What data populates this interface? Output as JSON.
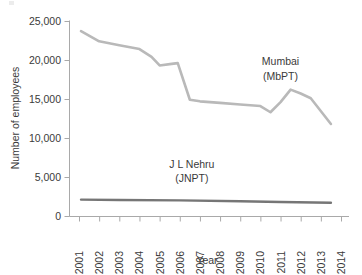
{
  "chart_data": {
    "type": "line",
    "title": "",
    "subtitle": "",
    "xlabel": "Year",
    "ylabel": "Number of employees",
    "xlim": [
      2001,
      2014
    ],
    "ylim": [
      0,
      25000
    ],
    "grid": false,
    "legend_position": "inline-annotations",
    "x_ticks": [
      "2001",
      "2002",
      "2003",
      "2004",
      "2005",
      "2006",
      "2007",
      "2008",
      "2009",
      "2010",
      "2011",
      "2012",
      "2013",
      "2014"
    ],
    "y_ticks": [
      "0",
      "5,000",
      "10,000",
      "15,000",
      "20,000",
      "25,000"
    ],
    "y_tick_values": [
      0,
      5000,
      10000,
      15000,
      20000,
      25000
    ],
    "series": [
      {
        "name": "Mumbai (MbPT)",
        "label_line1": "Mumbai",
        "label_line2": "(MbPT)",
        "color": "#b9b9b9",
        "x": [
          2001.1,
          2002.0,
          2003.0,
          2004.0,
          2004.6,
          2005.0,
          2005.6,
          2005.9,
          2006.5,
          2007.0,
          2008.0,
          2009.0,
          2010.0,
          2010.5,
          2011.0,
          2011.5,
          2012.0,
          2012.5,
          2013.5
        ],
        "values": [
          23700,
          22400,
          21900,
          21400,
          20400,
          19300,
          19500,
          19600,
          14900,
          14700,
          14500,
          14300,
          14100,
          13300,
          14600,
          16200,
          15700,
          15100,
          11800
        ]
      },
      {
        "name": "J L Nehru (JNPT)",
        "label_line1": "J L Nehru",
        "label_line2": "(JNPT)",
        "color": "#767676",
        "x": [
          2001.1,
          2003.0,
          2006.0,
          2009.0,
          2011.0,
          2013.5
        ],
        "values": [
          2100,
          2050,
          2000,
          1900,
          1800,
          1700
        ]
      }
    ],
    "annotations": [
      {
        "text": "Mumbai",
        "x": 2011.0,
        "y": 19300
      },
      {
        "text": "(MbPT)",
        "x": 2011.0,
        "y": 17400
      },
      {
        "text": "J L Nehru",
        "x": 2006.6,
        "y": 6200
      },
      {
        "text": "(JNPT)",
        "x": 2006.6,
        "y": 4300
      }
    ]
  }
}
